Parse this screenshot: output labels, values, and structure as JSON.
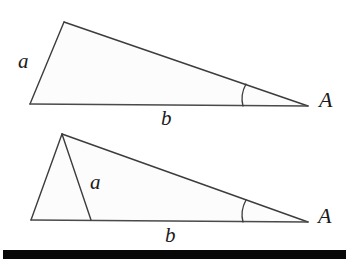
{
  "figure": {
    "background_color": "#ffffff",
    "stroke_color": "#3c3c3c",
    "fill_color": "#fcfcfc",
    "bar_color": "#080808",
    "labels": {
      "side_a": "a",
      "side_b": "b",
      "angle_A": "A"
    },
    "triangles": [
      {
        "name": "triangle-one",
        "description": "single triangle, side a on the left, base b, angle A at right vertex",
        "vertices": {
          "apex": [
            64,
            22
          ],
          "bottom_left": [
            30,
            104
          ],
          "right": [
            308,
            106
          ]
        },
        "angle_arc": {
          "top": [
            245,
            82
          ],
          "bottom": [
            243,
            106
          ]
        },
        "label_positions": {
          "side_a": [
            18,
            51
          ],
          "side_b": [
            161,
            108
          ],
          "angle_A": [
            319,
            89
          ]
        }
      },
      {
        "name": "triangle-two",
        "description": "triangle with an internal cevian of length a drawn from apex to base, base b, angle A at right vertex",
        "vertices": {
          "apex": [
            62,
            134
          ],
          "bottom_left": [
            31,
            220
          ],
          "right": [
            308,
            222
          ]
        },
        "cevian": {
          "from": [
            62,
            134
          ],
          "to": [
            91,
            220
          ]
        },
        "angle_arc": {
          "top": [
            245,
            198
          ],
          "bottom": [
            243,
            222
          ]
        },
        "label_positions": {
          "side_a": [
            90,
            172
          ],
          "side_b": [
            165,
            225
          ],
          "angle_A": [
            318,
            205
          ]
        }
      }
    ],
    "bottom_bar": {
      "x": 3,
      "y": 250,
      "width": 343,
      "height": 9
    }
  }
}
